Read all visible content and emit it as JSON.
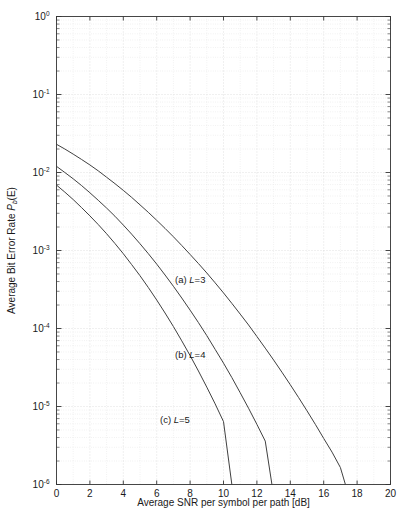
{
  "figure": {
    "background_color": "#ffffff",
    "axes_color": "#333333",
    "grid_color": "#d8d8d8",
    "curve_color": "#404040"
  },
  "chart_data": {
    "type": "line",
    "title": "",
    "subtitle": "",
    "xlabel": "Average SNR per symbol per path [dB]",
    "ylabel": "Average Bit Error Rate P_b(E)",
    "ylabel_parts": {
      "text": "Average Bit Error Rate ",
      "symbol": "P",
      "subscript": "b",
      "suffix": "(E)"
    },
    "xscale": "linear",
    "yscale": "log",
    "xlim": [
      0,
      20
    ],
    "ylim": [
      1e-06,
      1
    ],
    "grid": true,
    "grid_minor": true,
    "legend": "none",
    "xticks": [
      0,
      2,
      4,
      6,
      8,
      10,
      12,
      14,
      16,
      18,
      20
    ],
    "xticklabels": [
      "0",
      "2",
      "4",
      "6",
      "8",
      "10",
      "12",
      "14",
      "16",
      "18",
      "20"
    ],
    "yticks": [
      1,
      0.1,
      0.01,
      0.001,
      0.0001,
      1e-05,
      1e-06
    ],
    "yticklabels": [
      "10^0",
      "10^-1",
      "10^-2",
      "10^-3",
      "10^-4",
      "10^-5",
      "10^-6"
    ],
    "ytick_exponents": [
      "0",
      "-1",
      "-2",
      "-3",
      "-4",
      "-5",
      "-6"
    ],
    "ytick_base": "10",
    "annotations": [
      {
        "text_prefix": "(a) ",
        "symbol": "L",
        "text_suffix": "=3",
        "x": 7.1,
        "y": 0.00038
      },
      {
        "text_prefix": "(b) ",
        "symbol": "L",
        "text_suffix": "=4",
        "x": 7.1,
        "y": 4.2e-05
      },
      {
        "text_prefix": "(c) ",
        "symbol": "L",
        "text_suffix": "=5",
        "x": 6.2,
        "y": 6.2e-06
      }
    ],
    "series": [
      {
        "name": "(a) L=3",
        "label": "(a) L=3",
        "L": 3,
        "x": [
          0,
          0.5,
          1,
          1.5,
          2,
          2.5,
          3,
          3.5,
          4,
          4.5,
          5,
          5.5,
          6,
          6.5,
          7,
          7.5,
          8,
          8.5,
          9,
          9.5,
          10,
          10.5,
          11,
          11.5,
          12,
          12.5,
          13,
          13.5,
          14,
          14.5,
          15,
          15.5,
          16,
          16.5,
          17,
          17.3
        ],
        "y": [
          0.023,
          0.02,
          0.0172,
          0.0147,
          0.0125,
          0.0105,
          0.0087,
          0.0072,
          0.0059,
          0.0048,
          0.00385,
          0.00308,
          0.00244,
          0.00192,
          0.0015,
          0.00116,
          0.00089,
          0.00068,
          0.000515,
          0.000385,
          0.000286,
          0.00021,
          0.000153,
          0.000111,
          7.9e-05,
          5.6e-05,
          3.95e-05,
          2.75e-05,
          1.9e-05,
          1.3e-05,
          8.8e-06,
          5.9e-06,
          3.9e-06,
          2.6e-06,
          1.65e-06,
          1e-06
        ]
      },
      {
        "name": "(b) L=4",
        "label": "(b) L=4",
        "L": 4,
        "x": [
          0,
          0.5,
          1,
          1.5,
          2,
          2.5,
          3,
          3.5,
          4,
          4.5,
          5,
          5.5,
          6,
          6.5,
          7,
          7.5,
          8,
          8.5,
          9,
          9.5,
          10,
          10.5,
          11,
          11.5,
          12,
          12.5,
          12.9
        ],
        "y": [
          0.012,
          0.01,
          0.0083,
          0.0068,
          0.0055,
          0.0044,
          0.0035,
          0.00275,
          0.00212,
          0.00162,
          0.00122,
          0.00091,
          0.00067,
          0.000485,
          0.000348,
          0.000246,
          0.000172,
          0.000119,
          8.1e-05,
          5.4e-05,
          3.6e-05,
          2.35e-05,
          1.5e-05,
          9.5e-06,
          5.9e-06,
          3.6e-06,
          1e-06
        ]
      },
      {
        "name": "(c) L=5",
        "label": "(c) L=5",
        "L": 5,
        "x": [
          0,
          0.5,
          1,
          1.5,
          2,
          2.5,
          3,
          3.5,
          4,
          4.5,
          5,
          5.5,
          6,
          6.5,
          7,
          7.5,
          8,
          8.5,
          9,
          9.5,
          10,
          10.5
        ],
        "y": [
          0.0069,
          0.0056,
          0.0045,
          0.00355,
          0.00278,
          0.00215,
          0.00164,
          0.00123,
          0.00091,
          0.00066,
          0.000475,
          0.000335,
          0.000232,
          0.000158,
          0.000106,
          6.95e-05,
          4.5e-05,
          2.85e-05,
          1.77e-05,
          1.08e-05,
          6.4e-06,
          1e-06
        ]
      }
    ]
  }
}
